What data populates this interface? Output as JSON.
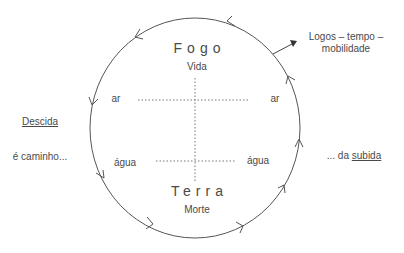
{
  "diagram": {
    "top_element": "Fogo",
    "top_subtitle": "Vida",
    "bottom_element": "Terra",
    "bottom_subtitle": "Morte",
    "air_left": "ar",
    "air_right": "ar",
    "water_left": "água",
    "water_right": "água",
    "left_heading": "Descida",
    "left_caption": "é caminho...",
    "right_caption_prefix": "... da ",
    "right_caption_emphasis": "subida",
    "logos_line1": "Logos – tempo –",
    "logos_line2": "mobilidade",
    "colors": {
      "stroke": "#555555",
      "text": "#4a4a4a",
      "background": "#ffffff"
    },
    "cycle_direction": "counter-clockwise (descending on left, ascending on right)"
  }
}
